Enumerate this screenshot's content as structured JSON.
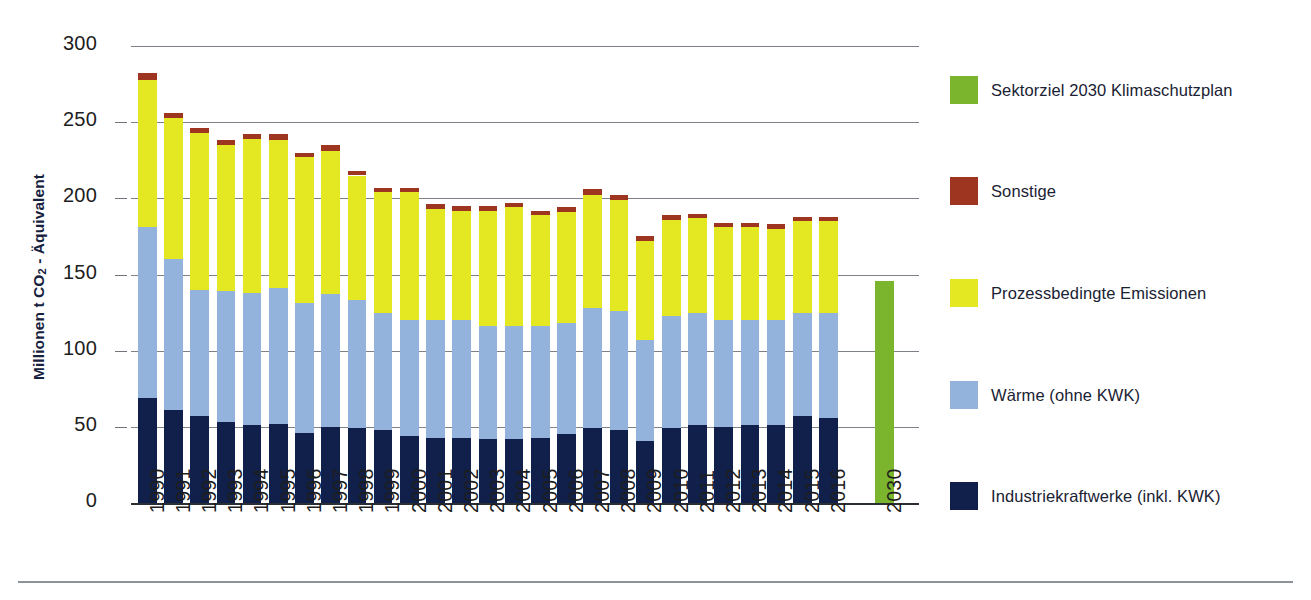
{
  "chart_data": {
    "type": "bar",
    "title": "",
    "subtitle": "",
    "xlabel": "",
    "ylabel": "Millionen t CO2 - Äquivalent",
    "ylabel_parts": {
      "pre": "Millionen t CO",
      "sub": "2",
      "post": " - Äquivalent"
    },
    "ylim": [
      0,
      300
    ],
    "yticks": [
      0,
      50,
      100,
      150,
      200,
      250,
      300
    ],
    "ytick_labels": [
      "0",
      "50",
      "100",
      "150",
      "200",
      "250",
      "300"
    ],
    "grid": true,
    "grid_axis": "y",
    "legend_position": "right",
    "stacked": true,
    "categories": [
      "1990",
      "1991",
      "1992",
      "1993",
      "1994",
      "1995",
      "1996",
      "1997",
      "1998",
      "1999",
      "2000",
      "2001",
      "2002",
      "2003",
      "2004",
      "2005",
      "2006",
      "2007",
      "2008",
      "2009",
      "2010",
      "2011",
      "2012",
      "2013",
      "2014",
      "2015",
      "2016"
    ],
    "target_category": "2030",
    "series": [
      {
        "name": "Industriekraftwerke (inkl. KWK)",
        "color": "#11204a",
        "values": [
          69,
          61,
          57,
          53,
          51,
          52,
          46,
          50,
          49,
          48,
          44,
          43,
          43,
          42,
          42,
          43,
          45,
          49,
          48,
          41,
          49,
          51,
          50,
          51,
          51,
          57,
          56
        ]
      },
      {
        "name": "Wärme (ohne KWK)",
        "color": "#93b2dc",
        "values": [
          112,
          99,
          83,
          86,
          87,
          89,
          85,
          87,
          84,
          77,
          76,
          77,
          77,
          74,
          74,
          73,
          73,
          79,
          78,
          66,
          74,
          74,
          70,
          69,
          69,
          68,
          69
        ]
      },
      {
        "name": "Prozessbedingte Emissionen",
        "color": "#e3e822",
        "values": [
          97,
          93,
          103,
          96,
          101,
          97,
          96,
          94,
          82,
          79,
          84,
          73,
          72,
          76,
          78,
          73,
          73,
          74,
          73,
          65,
          63,
          62,
          61,
          61,
          60,
          60,
          60
        ]
      },
      {
        "name": "Sonstige",
        "color": "#9e3521",
        "values": [
          4,
          3,
          3,
          3,
          3,
          4,
          3,
          4,
          3,
          3,
          3,
          3,
          3,
          3,
          3,
          3,
          3,
          4,
          3,
          3,
          3,
          3,
          3,
          3,
          3,
          3,
          3
        ]
      }
    ],
    "totals": [
      282,
      256,
      246,
      238,
      242,
      242,
      230,
      235,
      218,
      207,
      207,
      196,
      195,
      195,
      197,
      192,
      194,
      206,
      202,
      175,
      189,
      190,
      184,
      184,
      183,
      188,
      188
    ],
    "target": {
      "name": "Sektorziel 2030 Klimaschutzplan",
      "color": "#7ab52d",
      "category": "2030",
      "value": 146
    }
  },
  "legend": {
    "items": [
      {
        "label": "Sektorziel 2030 Klimaschutzplan",
        "color": "#7ab52d"
      },
      {
        "label": "Sonstige",
        "color": "#9e3521"
      },
      {
        "label": "Prozessbedingte Emissionen",
        "color": "#e3e822"
      },
      {
        "label": "Wärme (ohne KWK)",
        "color": "#93b2dc"
      },
      {
        "label": "Industriekraftwerke (inkl. KWK)",
        "color": "#11204a"
      }
    ]
  }
}
